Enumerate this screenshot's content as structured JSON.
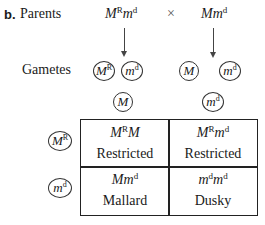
{
  "label_part": "b.",
  "rows": {
    "parents_label": "Parents",
    "gametes_label": "Gametes"
  },
  "parents": {
    "parent1": {
      "base1": "M",
      "sup1": "R",
      "base2": "m",
      "sup2": "d"
    },
    "cross_symbol": "×",
    "parent2": {
      "base1": "M",
      "base2": "m",
      "sup2": "d"
    }
  },
  "gametes": {
    "parent1": [
      {
        "base": "M",
        "sup": "R"
      },
      {
        "base": "m",
        "sup": "d"
      }
    ],
    "parent2": [
      {
        "base": "M",
        "sup": ""
      },
      {
        "base": "m",
        "sup": "d"
      }
    ]
  },
  "punnett": {
    "col_headers": [
      {
        "base": "M",
        "sup": ""
      },
      {
        "base": "m",
        "sup": "d"
      }
    ],
    "row_headers": [
      {
        "base": "M",
        "sup": "R"
      },
      {
        "base": "m",
        "sup": "d"
      }
    ],
    "cells": [
      [
        {
          "a": "M",
          "a_sup": "R",
          "b": "M",
          "b_sup": "",
          "phenotype": "Restricted"
        },
        {
          "a": "M",
          "a_sup": "R",
          "b": "m",
          "b_sup": "d",
          "phenotype": "Restricted"
        }
      ],
      [
        {
          "a": "M",
          "a_sup": "",
          "b": "m",
          "b_sup": "d",
          "phenotype": "Mallard"
        },
        {
          "a": "m",
          "a_sup": "d",
          "b": "m",
          "b_sup": "d",
          "phenotype": "Dusky"
        }
      ]
    ]
  }
}
